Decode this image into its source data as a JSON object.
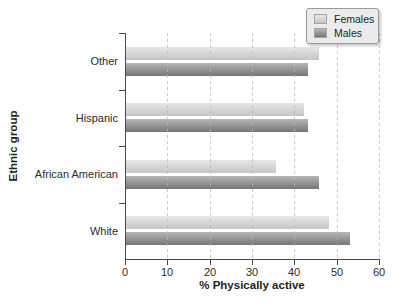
{
  "chart_data": {
    "type": "bar",
    "orientation": "horizontal",
    "title": "",
    "xlabel": "% Physically active",
    "ylabel": "Ethnic group",
    "categories": [
      "Other",
      "Hispanic",
      "African American",
      "White"
    ],
    "series": [
      {
        "name": "Females",
        "values": [
          45.5,
          42,
          35.5,
          48
        ]
      },
      {
        "name": "Males",
        "values": [
          43,
          43,
          45.5,
          53
        ]
      }
    ],
    "xlim": [
      0,
      60
    ],
    "xticks": [
      0,
      10,
      20,
      30,
      40,
      50,
      60
    ],
    "grid": "vertical-dashed",
    "legend_position": "top-right"
  },
  "colors": {
    "females_bar_top": "#e7e7e7",
    "females_bar_bottom": "#c6c6c6",
    "males_bar_top": "#b6b6b6",
    "males_bar_bottom": "#767676",
    "axis": "#4a4a4a",
    "gridline": "#bfbfbf",
    "legend_background": "#ebebeb"
  }
}
